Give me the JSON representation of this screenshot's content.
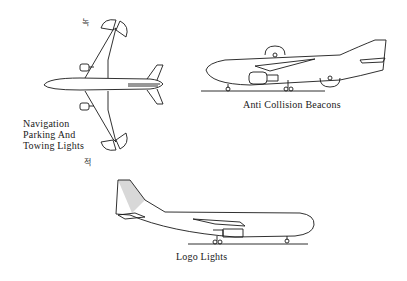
{
  "diagram": {
    "title": "",
    "views": [
      {
        "id": "top-view",
        "label_lines": [
          "Navigation",
          "Parking And",
          "Towing Lights"
        ],
        "markers": {
          "left_wing": "녹",
          "right_wing": "적"
        }
      },
      {
        "id": "side-view-right",
        "label": "Anti Collision Beacons"
      },
      {
        "id": "side-view-left",
        "label": "Logo Lights"
      }
    ]
  },
  "colors": {
    "line": "#1a1a1a",
    "background": "#ffffff",
    "logo_highlight": "#d8d8d8"
  }
}
